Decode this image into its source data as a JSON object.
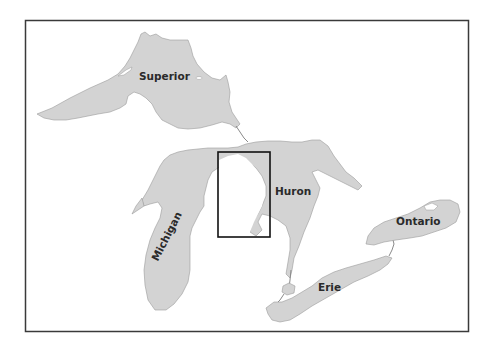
{
  "map": {
    "title": "Great Lakes",
    "lakes": [
      {
        "name": "Superior",
        "label": "Superior"
      },
      {
        "name": "Michigan",
        "label": "Michigan"
      },
      {
        "name": "Huron",
        "label": "Huron"
      },
      {
        "name": "Erie",
        "label": "Erie"
      },
      {
        "name": "Ontario",
        "label": "Ontario"
      }
    ],
    "highlight_box": {
      "description": "study area rectangle on eastern Lake Michigan / Michigan shoreline",
      "x": 218,
      "y": 152,
      "width": 52,
      "height": 85
    },
    "colors": {
      "water": "#d3d3d3",
      "land": "#ffffff",
      "frame": "#3a3a3a",
      "box": "#111111",
      "label": "#2a2a2a"
    }
  }
}
